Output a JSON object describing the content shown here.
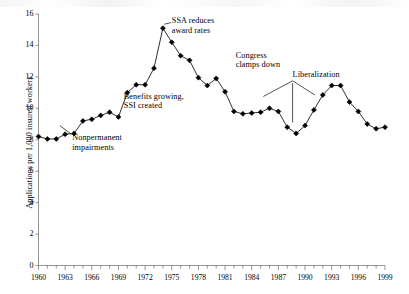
{
  "figure": {
    "ylabel": "Applications per 1,000 insured workers",
    "axis_color": "#7a7a7a",
    "line_color": "#1a1a1a",
    "marker_color": "#000000"
  },
  "chart_data": {
    "type": "line",
    "title": "",
    "xlabel": "",
    "ylabel": "Applications per 1,000 insured workers",
    "xlim": [
      1960,
      1999
    ],
    "ylim": [
      0,
      16
    ],
    "yticks": [
      0,
      2,
      4,
      6,
      8,
      10,
      12,
      14,
      16
    ],
    "xticks": [
      1960,
      1963,
      1966,
      1969,
      1972,
      1975,
      1978,
      1981,
      1984,
      1987,
      1990,
      1993,
      1996,
      1999
    ],
    "xtick_labels": [
      "1960",
      "1963",
      "1966",
      "1969",
      "1972",
      "1975",
      "1978",
      "1981",
      "1984",
      "1987",
      "1990",
      "1993",
      "1996",
      "1999"
    ],
    "ytick_labels": [
      "0",
      "2",
      "4",
      "6",
      "8",
      "10",
      "12",
      "14",
      "16"
    ],
    "grid": false,
    "legend": "none",
    "marker": "diamond",
    "x": [
      1960,
      1961,
      1962,
      1963,
      1964,
      1965,
      1966,
      1967,
      1968,
      1969,
      1970,
      1971,
      1972,
      1973,
      1974,
      1975,
      1976,
      1977,
      1978,
      1979,
      1980,
      1981,
      1982,
      1983,
      1984,
      1985,
      1986,
      1987,
      1988,
      1989,
      1990,
      1991,
      1992,
      1993,
      1994,
      1995,
      1996,
      1997,
      1998,
      1999
    ],
    "values": [
      8.2,
      8.05,
      8.05,
      8.35,
      8.4,
      9.2,
      9.3,
      9.55,
      9.75,
      9.45,
      11.0,
      11.5,
      11.5,
      12.55,
      15.1,
      14.2,
      13.35,
      13.05,
      11.95,
      11.45,
      11.9,
      11.05,
      9.8,
      9.65,
      9.7,
      9.75,
      10.0,
      9.8,
      8.8,
      8.4,
      8.9,
      9.9,
      10.85,
      11.45,
      11.45,
      10.4,
      9.8,
      9.0,
      8.7,
      8.8
    ],
    "annotations": [
      {
        "id": "nonpermanent-impairments",
        "text_lines": [
          "Nonpermanent",
          "impairments"
        ],
        "x": 1963.8,
        "y": 8.15
      },
      {
        "id": "benefits-growing-ssi-created",
        "text_lines": [
          "Benefits growing,",
          "SSI created"
        ],
        "x": 1969.6,
        "y": 10.8
      },
      {
        "id": "ssa-reduces-award-rates",
        "text_lines": [
          "SSA reduces",
          "award rates"
        ],
        "x": 1975.0,
        "y": 15.6
      },
      {
        "id": "congress-clamps-down",
        "text_lines": [
          "Congress",
          "clamps down"
        ],
        "x": 1982.2,
        "y": 13.4
      },
      {
        "id": "liberalization",
        "text_lines": [
          "Liberalization"
        ],
        "x": 1988.6,
        "y": 12.2
      }
    ]
  }
}
